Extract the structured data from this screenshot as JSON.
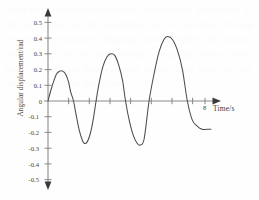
{
  "figure": {
    "background_text": "www.physicsandmathstutor.com experiment amplitude of the oscillation of the pendulum bob is recorded driving frequency resonance damping occurs when the system loses energy to the surroundings the graph below shows how the angular displacement varies with time for the oscillating system described"
  },
  "axes": {
    "y_axis_label": "Angular displacement/rad",
    "x_axis_label": "Time/s",
    "x_end_tick_label": "8",
    "y_tick_labels": [
      "0.5",
      "0.4",
      "0.3",
      "0.2",
      "0.1",
      "0",
      "-0.1",
      "-0.2",
      "-0.3",
      "-0.4",
      "-0.5"
    ],
    "axis_color": "#808080",
    "curve_color": "#4c4c4c"
  },
  "chart_data": {
    "type": "line",
    "title": "",
    "subtitle": "",
    "xlabel": "Time/s",
    "ylabel": "Angular displacement/rad",
    "xlim": [
      0,
      8.6
    ],
    "ylim": [
      -0.5,
      0.5
    ],
    "grid": false,
    "legend": false,
    "x_ticks": [
      1,
      2,
      3,
      4,
      5,
      6,
      7,
      8
    ],
    "x_tick_labels": [
      "",
      "",
      "",
      "",
      "",
      "",
      "",
      "8"
    ],
    "y_ticks": [
      -0.5,
      -0.4,
      -0.3,
      -0.2,
      -0.1,
      0,
      0.1,
      0.2,
      0.3,
      0.4,
      0.5
    ],
    "annotations": [
      {
        "text": "8",
        "x": 8,
        "y": -0.06
      }
    ],
    "series": [
      {
        "name": "angular displacement",
        "description": "growing oscillation: three cycles of increasing amplitude",
        "peaks": [
          {
            "x": 0.75,
            "y": 0.19
          },
          {
            "x": 3.2,
            "y": 0.3
          },
          {
            "x": 6.1,
            "y": 0.41
          }
        ],
        "troughs": [
          {
            "x": 1.85,
            "y": -0.27
          },
          {
            "x": 4.7,
            "y": -0.28
          }
        ],
        "zero_crossings": [
          0,
          1.3,
          2.45,
          3.95,
          5.15,
          7.1
        ],
        "x": [
          0.0,
          0.15,
          0.3,
          0.45,
          0.6,
          0.75,
          0.9,
          1.05,
          1.15,
          1.3,
          1.45,
          1.6,
          1.75,
          1.85,
          2.0,
          2.15,
          2.3,
          2.45,
          2.6,
          2.8,
          3.0,
          3.2,
          3.4,
          3.6,
          3.8,
          3.95,
          4.15,
          4.35,
          4.55,
          4.7,
          4.9,
          5.15,
          5.4,
          5.65,
          5.9,
          6.1,
          6.35,
          6.6,
          6.85,
          7.1,
          7.35,
          7.6,
          7.85,
          8.1,
          8.3
        ],
        "y": [
          0.0,
          0.07,
          0.13,
          0.175,
          0.19,
          0.19,
          0.17,
          0.12,
          0.06,
          0.0,
          -0.1,
          -0.19,
          -0.25,
          -0.27,
          -0.26,
          -0.21,
          -0.12,
          0.0,
          0.11,
          0.22,
          0.28,
          0.3,
          0.29,
          0.23,
          0.13,
          0.0,
          -0.13,
          -0.22,
          -0.27,
          -0.28,
          -0.24,
          0.0,
          0.17,
          0.31,
          0.39,
          0.41,
          0.39,
          0.32,
          0.2,
          0.0,
          -0.12,
          -0.16,
          -0.18,
          -0.18,
          -0.18
        ]
      }
    ]
  }
}
